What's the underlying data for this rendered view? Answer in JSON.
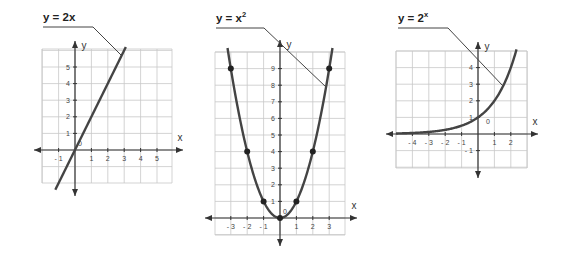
{
  "chart_data": [
    {
      "type": "line",
      "title": "y = 2x",
      "xlabel": "x",
      "ylabel": "y",
      "origin_label": "0",
      "x_ticks": [
        -1,
        1,
        2,
        3,
        4,
        5
      ],
      "y_ticks": [
        1,
        2,
        3,
        4,
        5
      ],
      "xlim": [
        -2,
        6
      ],
      "ylim": [
        -2,
        6
      ],
      "grid": true,
      "series": [
        {
          "name": "y = 2x",
          "x": [
            -1.2,
            3.1
          ],
          "y": [
            -2.4,
            6.2
          ]
        }
      ]
    },
    {
      "type": "line",
      "title": "y = x²",
      "xlabel": "x",
      "ylabel": "y",
      "origin_label": "0",
      "x_ticks": [
        -3,
        -2,
        -1,
        1,
        2,
        3
      ],
      "y_ticks": [
        1,
        2,
        3,
        4,
        5,
        6,
        7,
        8,
        9
      ],
      "xlim": [
        -4,
        4
      ],
      "ylim": [
        -1,
        10
      ],
      "grid": true,
      "series": [
        {
          "name": "y = x²",
          "x": [
            -3,
            -2,
            -1,
            0,
            1,
            2,
            3
          ],
          "y": [
            9,
            4,
            1,
            0,
            1,
            4,
            9
          ]
        }
      ],
      "marked_points": [
        [
          -3,
          9
        ],
        [
          -2,
          4
        ],
        [
          -1,
          1
        ],
        [
          0,
          0
        ],
        [
          1,
          1
        ],
        [
          2,
          4
        ],
        [
          3,
          9
        ]
      ]
    },
    {
      "type": "line",
      "title": "y = 2ˣ",
      "xlabel": "x",
      "ylabel": "y",
      "origin_label": "0",
      "x_ticks": [
        -4,
        -3,
        -2,
        -1,
        1,
        2
      ],
      "y_ticks": [
        -1,
        1,
        2,
        3,
        4
      ],
      "xlim": [
        -5,
        3
      ],
      "ylim": [
        -2,
        5
      ],
      "grid": true,
      "series": [
        {
          "name": "y = 2^x",
          "x": [
            -5,
            -4,
            -3,
            -2,
            -1,
            0,
            1,
            2,
            2.3
          ],
          "y": [
            0.03,
            0.06,
            0.125,
            0.25,
            0.5,
            1,
            2,
            4,
            4.9
          ]
        }
      ]
    }
  ],
  "labels": {
    "g1_title": "y = 2x",
    "g2_title_base": "y = x",
    "g2_title_exp": "2",
    "g3_title_base": "y = 2",
    "g3_title_exp": "x",
    "x": "x",
    "y": "y",
    "origin": "0"
  }
}
